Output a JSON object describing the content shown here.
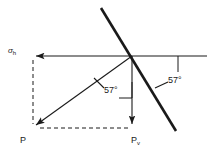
{
  "figure": {
    "type": "force-resolution-diagram",
    "background_color": "#ffffff",
    "line_color": "#1a1a1a",
    "labels": {
      "horizontal_component": "σ",
      "horizontal_component_subscript": "h",
      "vertical_component": "P",
      "vertical_component_subscript": "v",
      "resultant": "P",
      "angle_plane": "57°",
      "angle_resultant": "57°"
    },
    "angles": {
      "plane_inclination_deg": 57,
      "resultant_from_vertical_deg": 57
    },
    "geometry": {
      "origin_x": 132,
      "origin_y": 56,
      "p_tip_x": 33,
      "p_tip_y": 128,
      "pv_tip_x": 132,
      "pv_tip_y": 128,
      "sigma_tip_x": 33,
      "sigma_tip_y": 56
    }
  }
}
